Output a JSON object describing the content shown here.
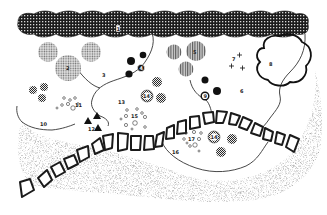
{
  "diagram": {
    "type": "landscape planting plan",
    "colors": {
      "background": "#ffffff",
      "hedge": "#1c1c1c",
      "ink": "#1a1a1a",
      "gravel": "#9a9a9a"
    },
    "hedge": {
      "label": "1"
    },
    "beds": [
      {
        "id": "bed-3",
        "label": "3"
      },
      {
        "id": "bed-6",
        "label": "6"
      },
      {
        "id": "bed-10",
        "label": "10"
      },
      {
        "id": "bed-13",
        "label": "13"
      },
      {
        "id": "bed-16",
        "label": "16"
      }
    ],
    "plants": {
      "p2": {
        "label": "2"
      },
      "p4": {
        "label": "4"
      },
      "p5": {
        "label": "5"
      },
      "p7": {
        "label": "7"
      },
      "p8": {
        "label": "8"
      },
      "p9": {
        "label": "9"
      },
      "p11": {
        "label": "11"
      },
      "p12": {
        "label": "12"
      },
      "p14a": {
        "label": "14"
      },
      "p14b": {
        "label": "14"
      },
      "p15": {
        "label": "15"
      },
      "p17": {
        "label": "17"
      }
    },
    "path": {
      "name": "stepping-stone path",
      "stone_count": 22
    }
  }
}
